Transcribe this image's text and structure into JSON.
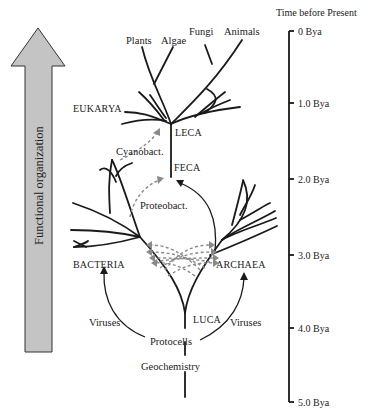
{
  "figure": {
    "arrow": {
      "label": "Functional organization",
      "fill_color": "#c4c4c4",
      "stroke_color": "#333333"
    },
    "time_axis": {
      "title": "Time before Present",
      "ticks": [
        {
          "label": "0 Bya",
          "value": 0
        },
        {
          "label": "1.0 Bya",
          "value": 1.0
        },
        {
          "label": "2.0 Bya",
          "value": 2.0
        },
        {
          "label": "3.0 Bya",
          "value": 3.0
        },
        {
          "label": "4.0 Bya",
          "value": 4.0
        },
        {
          "label": "5.0 Bya",
          "value": 5.0
        }
      ]
    },
    "tree_labels": {
      "plants": "Plants",
      "algae": "Algae",
      "fungi": "Fungi",
      "animals": "Animals",
      "eukarya": "EUKARYA",
      "leca": "LECA",
      "cyanobact": "Cyanobact.",
      "feca": "FECA",
      "proteobact": "Proteobact.",
      "bacteria": "BACTERIA",
      "archaea": "ARCHAEA",
      "luca": "LUCA",
      "viruses_left": "Viruses",
      "viruses_right": "Viruses",
      "protocells": "Protocells",
      "geochemistry": "Geochemistry"
    },
    "colors": {
      "line": "#1a1a1a",
      "dashed_transfer": "#8a8a8a",
      "text": "#222222"
    }
  }
}
